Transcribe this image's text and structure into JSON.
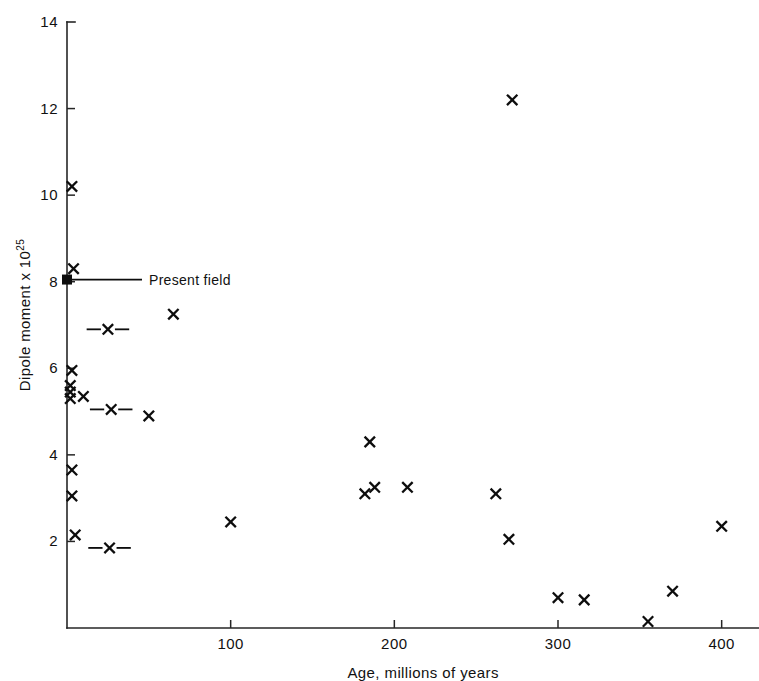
{
  "chart_data": {
    "type": "scatter",
    "title": "",
    "xlabel": "Age, millions of years",
    "ylabel": "Dipole moment x 10",
    "ylabel_exponent": "25",
    "xlim": [
      0,
      423
    ],
    "ylim": [
      0,
      14
    ],
    "xticks": [
      100,
      200,
      300,
      400
    ],
    "xtick_labels": [
      "100",
      "200",
      "300",
      "400"
    ],
    "yticks": [
      2,
      4,
      6,
      8,
      10,
      12,
      14
    ],
    "ytick_labels": [
      "2",
      "4",
      "6",
      "8",
      "10",
      "12",
      "14"
    ],
    "grid": false,
    "legend": "none",
    "marker": "x",
    "points": [
      {
        "x": 3,
        "y": 10.2
      },
      {
        "x": 4,
        "y": 8.3
      },
      {
        "x": 272,
        "y": 12.2
      },
      {
        "x": 65,
        "y": 7.25
      },
      {
        "x": 3,
        "y": 5.95
      },
      {
        "x": 2,
        "y": 5.6
      },
      {
        "x": 2,
        "y": 5.45
      },
      {
        "x": 2,
        "y": 5.3
      },
      {
        "x": 10,
        "y": 5.35
      },
      {
        "x": 50,
        "y": 4.9
      },
      {
        "x": 3,
        "y": 3.65
      },
      {
        "x": 3,
        "y": 3.05
      },
      {
        "x": 5,
        "y": 2.15
      },
      {
        "x": 100,
        "y": 2.45
      },
      {
        "x": 185,
        "y": 4.3
      },
      {
        "x": 182,
        "y": 3.1
      },
      {
        "x": 188,
        "y": 3.25
      },
      {
        "x": 208,
        "y": 3.25
      },
      {
        "x": 262,
        "y": 3.1
      },
      {
        "x": 270,
        "y": 2.05
      },
      {
        "x": 300,
        "y": 0.7
      },
      {
        "x": 316,
        "y": 0.65
      },
      {
        "x": 355,
        "y": 0.15
      },
      {
        "x": 370,
        "y": 0.85
      },
      {
        "x": 400,
        "y": 2.35
      }
    ],
    "points_with_error": [
      {
        "x": 25,
        "y": 6.9,
        "xerr": 13
      },
      {
        "x": 27,
        "y": 5.05,
        "xerr": 13
      },
      {
        "x": 26,
        "y": 1.85,
        "xerr": 13
      }
    ],
    "annotations": [
      {
        "label": "Present field",
        "x": 0,
        "y": 8.05,
        "marker": "filled-square"
      }
    ]
  },
  "colors": {
    "marker": "#0d0d0d",
    "axis": "#262626",
    "background": "#ffffff"
  }
}
